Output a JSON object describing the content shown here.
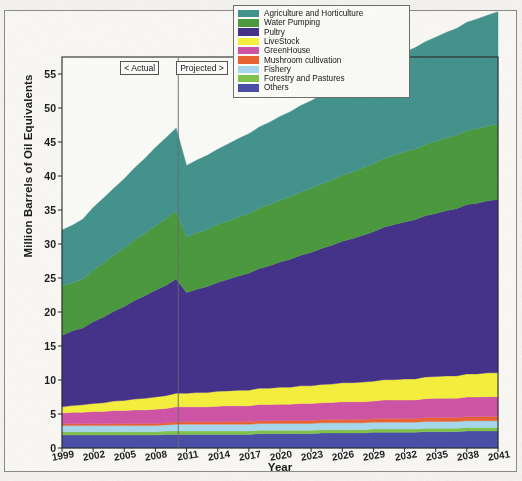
{
  "chart_data": {
    "type": "area",
    "stacked": true,
    "title": "",
    "xlabel": "Year",
    "ylabel": "Million Barrels of Oil Equivalents",
    "xlim": [
      1999,
      2041
    ],
    "ylim": [
      0,
      57.5
    ],
    "ytick_labels": [
      "0",
      "5",
      "10",
      "15",
      "20",
      "25",
      "30",
      "35",
      "40",
      "45",
      "50",
      "55"
    ],
    "ytick_values": [
      0,
      5,
      10,
      15,
      20,
      25,
      30,
      35,
      40,
      45,
      50,
      55
    ],
    "xtick_labels": [
      "1999",
      "2002",
      "2005",
      "2008",
      "2011",
      "2014",
      "2017",
      "2020",
      "2023",
      "2026",
      "2029",
      "2032",
      "2035",
      "2038",
      "2041"
    ],
    "xtick_values": [
      1999,
      2002,
      2005,
      2008,
      2011,
      2014,
      2017,
      2020,
      2023,
      2026,
      2029,
      2032,
      2035,
      2038,
      2041
    ],
    "grid": false,
    "legend_position": "top-center",
    "x": [
      1999,
      2000,
      2001,
      2002,
      2003,
      2004,
      2005,
      2006,
      2007,
      2008,
      2009,
      2010,
      2011,
      2012,
      2013,
      2014,
      2015,
      2016,
      2017,
      2018,
      2019,
      2020,
      2021,
      2022,
      2023,
      2024,
      2025,
      2026,
      2027,
      2028,
      2029,
      2030,
      2031,
      2032,
      2033,
      2034,
      2035,
      2036,
      2037,
      2038,
      2039,
      2040,
      2041
    ],
    "series": [
      {
        "name": "Others",
        "color": "#4b4fa8",
        "values": [
          1.9,
          1.9,
          1.9,
          1.9,
          1.9,
          1.9,
          1.9,
          1.9,
          1.9,
          1.9,
          2.0,
          2.0,
          2.0,
          2.0,
          2.0,
          2.0,
          2.0,
          2.0,
          2.0,
          2.1,
          2.1,
          2.1,
          2.1,
          2.1,
          2.1,
          2.2,
          2.2,
          2.2,
          2.2,
          2.2,
          2.3,
          2.3,
          2.3,
          2.3,
          2.3,
          2.4,
          2.4,
          2.4,
          2.4,
          2.5,
          2.5,
          2.5,
          2.5
        ]
      },
      {
        "name": "Forestry and Pastures",
        "color": "#83c44e",
        "values": [
          0.5,
          0.5,
          0.5,
          0.5,
          0.5,
          0.5,
          0.5,
          0.5,
          0.5,
          0.5,
          0.5,
          0.5,
          0.5,
          0.5,
          0.5,
          0.5,
          0.5,
          0.5,
          0.5,
          0.5,
          0.5,
          0.5,
          0.5,
          0.5,
          0.5,
          0.5,
          0.5,
          0.5,
          0.5,
          0.5,
          0.5,
          0.5,
          0.5,
          0.5,
          0.5,
          0.5,
          0.5,
          0.5,
          0.5,
          0.5,
          0.5,
          0.5,
          0.5
        ]
      },
      {
        "name": "Fishery",
        "color": "#a8daef",
        "values": [
          0.9,
          0.9,
          0.9,
          0.9,
          0.9,
          0.9,
          0.9,
          0.9,
          0.9,
          0.9,
          0.9,
          1.0,
          1.0,
          1.0,
          1.0,
          1.0,
          1.0,
          1.0,
          1.0,
          1.0,
          1.0,
          1.0,
          1.0,
          1.0,
          1.0,
          1.0,
          1.0,
          1.0,
          1.0,
          1.0,
          1.0,
          1.0,
          1.0,
          1.0,
          1.0,
          1.0,
          1.0,
          1.0,
          1.0,
          1.0,
          1.0,
          1.0,
          1.0
        ]
      },
      {
        "name": "Mushroom cultivation",
        "color": "#ec6433",
        "values": [
          0.25,
          0.25,
          0.25,
          0.25,
          0.25,
          0.3,
          0.3,
          0.3,
          0.3,
          0.3,
          0.3,
          0.35,
          0.35,
          0.35,
          0.35,
          0.35,
          0.4,
          0.4,
          0.4,
          0.4,
          0.4,
          0.45,
          0.45,
          0.45,
          0.45,
          0.45,
          0.5,
          0.5,
          0.5,
          0.5,
          0.5,
          0.55,
          0.55,
          0.55,
          0.55,
          0.55,
          0.6,
          0.6,
          0.6,
          0.6,
          0.6,
          0.65,
          0.65
        ]
      },
      {
        "name": "GreenHouse",
        "color": "#d155a8",
        "values": [
          1.6,
          1.7,
          1.7,
          1.8,
          1.8,
          1.9,
          1.9,
          2.0,
          2.0,
          2.1,
          2.1,
          2.2,
          2.2,
          2.2,
          2.2,
          2.3,
          2.3,
          2.3,
          2.3,
          2.4,
          2.4,
          2.4,
          2.4,
          2.5,
          2.5,
          2.5,
          2.5,
          2.6,
          2.6,
          2.6,
          2.6,
          2.7,
          2.7,
          2.7,
          2.7,
          2.8,
          2.8,
          2.8,
          2.8,
          2.9,
          2.9,
          2.9,
          2.9
        ]
      },
      {
        "name": "LiveStock",
        "color": "#f7f23e",
        "values": [
          0.9,
          1.0,
          1.1,
          1.2,
          1.3,
          1.4,
          1.5,
          1.6,
          1.7,
          1.8,
          1.9,
          2.0,
          2.0,
          2.1,
          2.1,
          2.2,
          2.2,
          2.3,
          2.3,
          2.4,
          2.4,
          2.5,
          2.5,
          2.6,
          2.6,
          2.7,
          2.7,
          2.8,
          2.8,
          2.9,
          2.9,
          3.0,
          3.0,
          3.1,
          3.1,
          3.2,
          3.2,
          3.3,
          3.3,
          3.4,
          3.4,
          3.5,
          3.5
        ]
      },
      {
        "name": "Pultry",
        "color": "#46338c",
        "values": [
          10.5,
          11.0,
          11.3,
          12.0,
          12.6,
          13.2,
          13.8,
          14.5,
          15.1,
          15.7,
          16.2,
          16.8,
          14.8,
          15.2,
          15.6,
          16.0,
          16.4,
          16.8,
          17.2,
          17.6,
          18.0,
          18.4,
          18.8,
          19.2,
          19.6,
          20.0,
          20.4,
          20.8,
          21.2,
          21.6,
          22.0,
          22.4,
          22.8,
          23.1,
          23.4,
          23.7,
          24.0,
          24.3,
          24.6,
          24.9,
          25.1,
          25.3,
          25.5
        ]
      },
      {
        "name": "Water Pumping",
        "color": "#4c9b3f",
        "values": [
          7.3,
          7.0,
          7.2,
          7.6,
          8.0,
          8.3,
          8.6,
          8.9,
          9.2,
          9.5,
          9.8,
          10.0,
          8.2,
          8.3,
          8.4,
          8.5,
          8.6,
          8.7,
          8.8,
          8.9,
          9.0,
          9.1,
          9.2,
          9.3,
          9.4,
          9.5,
          9.6,
          9.7,
          9.8,
          9.9,
          10.0,
          10.1,
          10.2,
          10.3,
          10.4,
          10.5,
          10.6,
          10.7,
          10.8,
          10.9,
          11.0,
          11.0,
          11.1
        ]
      },
      {
        "name": "Agriculture and Horticulture",
        "color": "#45948e",
        "values": [
          8.2,
          8.5,
          8.8,
          9.2,
          9.5,
          9.8,
          10.2,
          10.6,
          11.0,
          11.5,
          11.9,
          12.2,
          10.5,
          10.7,
          10.9,
          11.1,
          11.3,
          11.5,
          11.7,
          11.9,
          12.1,
          12.3,
          12.5,
          12.7,
          12.9,
          13.1,
          13.3,
          13.5,
          13.7,
          13.9,
          14.1,
          14.3,
          14.5,
          14.7,
          14.9,
          15.1,
          15.3,
          15.5,
          15.7,
          15.9,
          16.1,
          16.3,
          16.5
        ]
      }
    ],
    "annotations": [
      {
        "text": "< Actual",
        "x": 2006.5
      },
      {
        "text": "Projected >",
        "x": 2012.5
      },
      {
        "divider_at": 2010.2
      }
    ]
  },
  "legend": {
    "items": [
      {
        "label": "Agriculture and Horticulture",
        "color": "#45948e"
      },
      {
        "label": "Water Pumping",
        "color": "#4c9b3f"
      },
      {
        "label": "Pultry",
        "color": "#46338c"
      },
      {
        "label": "LiveStock",
        "color": "#f7f23e"
      },
      {
        "label": "GreenHouse",
        "color": "#d155a8"
      },
      {
        "label": "Mushroom cultivation",
        "color": "#ec6433"
      },
      {
        "label": "Fishery",
        "color": "#a8daef"
      },
      {
        "label": "Forestry and Pastures",
        "color": "#83c44e"
      },
      {
        "label": "Others",
        "color": "#4b4fa8"
      }
    ]
  }
}
